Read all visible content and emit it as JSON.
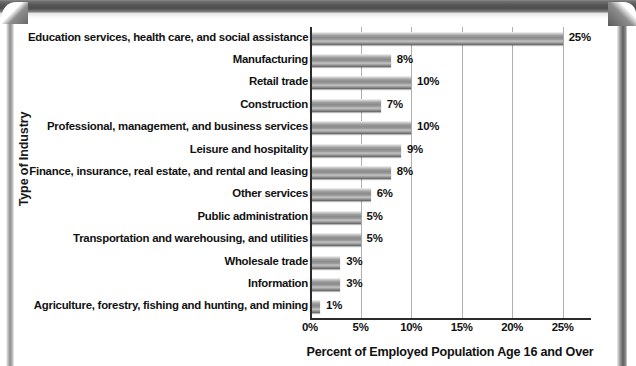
{
  "chart_data": {
    "type": "bar",
    "orientation": "horizontal",
    "title": "",
    "xlabel": "Percent of Employed Population Age 16 and Over",
    "ylabel": "Type of Industry",
    "xlim": [
      0,
      27.5
    ],
    "xticks": [
      "0%",
      "5%",
      "10%",
      "15%",
      "20%",
      "25%"
    ],
    "xtick_values": [
      0,
      5,
      10,
      15,
      20,
      25
    ],
    "grid": "vertical",
    "legend": "none",
    "categories": [
      "Education services, health care, and social assistance",
      "Manufacturing",
      "Retail trade",
      "Construction",
      "Professional, management, and business services",
      "Leisure and hospitality",
      "Finance, insurance, real estate, and rental and leasing",
      "Other services",
      "Public administration",
      "Transportation and warehousing, and utilities",
      "Wholesale trade",
      "Information",
      "Agriculture, forestry, fishing and hunting, and mining"
    ],
    "values": [
      25,
      8,
      10,
      7,
      10,
      9,
      8,
      6,
      5,
      5,
      3,
      3,
      1
    ],
    "data_labels": [
      "25%",
      "8%",
      "10%",
      "7%",
      "10%",
      "9%",
      "8%",
      "6%",
      "5%",
      "5%",
      "3%",
      "3%",
      "1%"
    ],
    "bar_color": "#8a8a8a",
    "gridline_color": "#b0b0b0",
    "axis_color": "#2b2b2b",
    "text_color": "#111111"
  }
}
